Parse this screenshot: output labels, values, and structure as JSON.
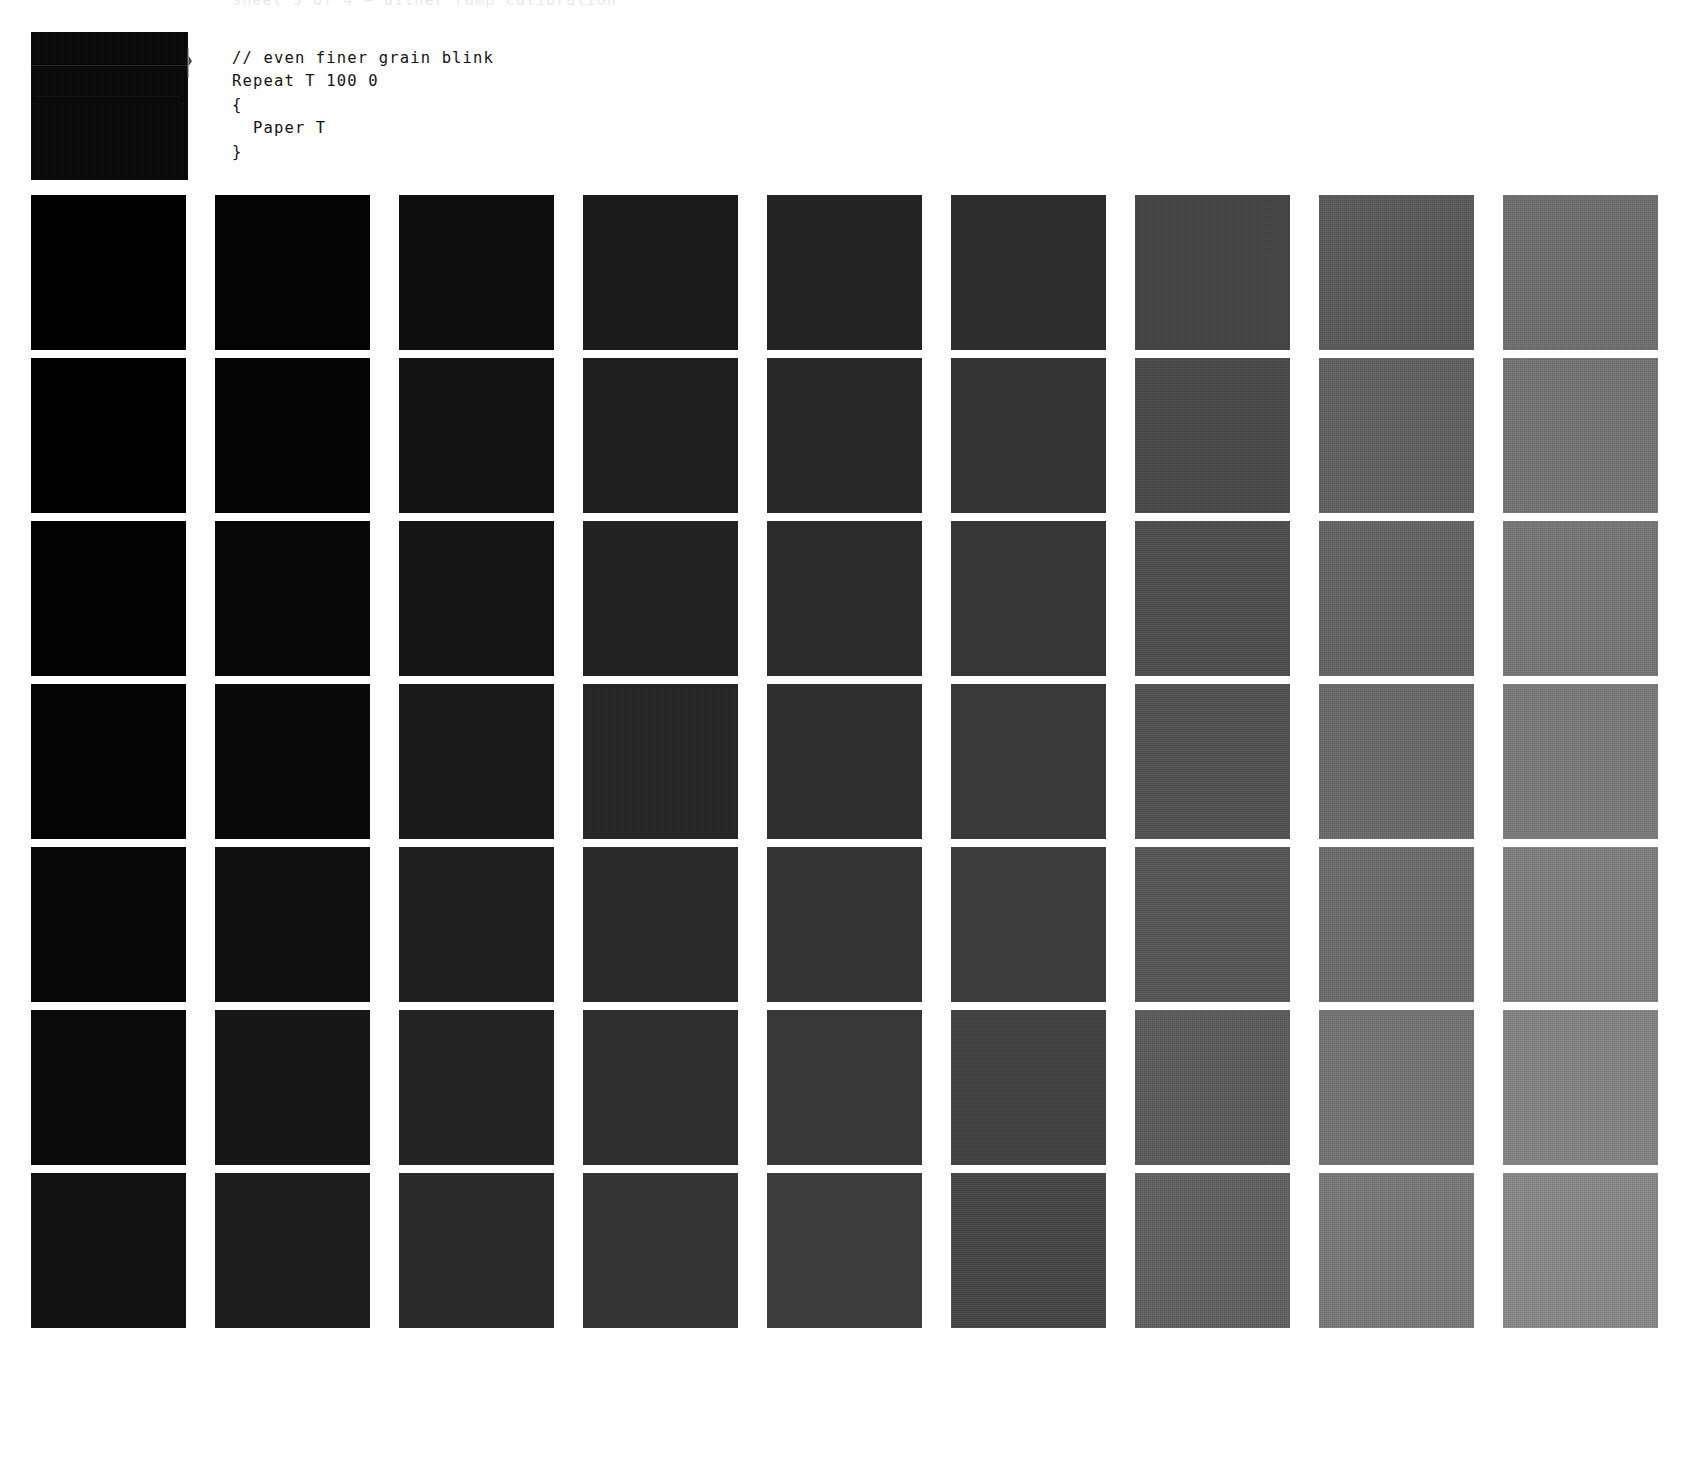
{
  "page": {
    "background": "#ffffff",
    "clipped_header_text": "sheet 3 of 4 — dither ramp calibration",
    "ink_color": "#141414"
  },
  "preview": {
    "name": "render-preview-thumbnail",
    "fill": "#050505",
    "scanline_color": "#2e2e2e",
    "marker_icon": "playhead-marker-icon"
  },
  "code": {
    "language": "paper-script",
    "lines": [
      "// even finer grain blink",
      "Repeat T 100 0",
      "{",
      "  Paper T",
      "}"
    ]
  },
  "grid": {
    "columns": 9,
    "rows": 7,
    "cell_size": 155,
    "col_pitch": 184,
    "row_pitch": 163,
    "origin_x": 31,
    "origin_y": 195,
    "swatches": [
      [
        "#020202",
        "#040404",
        "#0f0f0f",
        "#1b1b1b",
        "#242424",
        "#2d2d2d",
        "#454545",
        "#5b5b5b",
        "#6e6e6e"
      ],
      [
        "#020202",
        "#050505",
        "#131313",
        "#1e1e1e",
        "#282828",
        "#333333",
        "#4b4b4b",
        "#616161",
        "#737373"
      ],
      [
        "#030303",
        "#070707",
        "#151515",
        "#222222",
        "#2b2b2b",
        "#363636",
        "#4f4f4f",
        "#656565",
        "#767676"
      ],
      [
        "#040404",
        "#0a0a0a",
        "#1a1a1a",
        "#262626",
        "#2f2f2f",
        "#3a3a3a",
        "#535353",
        "#696969",
        "#7a7a7a"
      ],
      [
        "#070707",
        "#101010",
        "#1f1f1f",
        "#2a2a2a",
        "#333333",
        "#3e3e3e",
        "#575757",
        "#6d6d6d",
        "#7e7e7e"
      ],
      [
        "#0b0b0b",
        "#171717",
        "#242424",
        "#2f2f2f",
        "#383838",
        "#434343",
        "#5c5c5c",
        "#727272",
        "#828282"
      ],
      [
        "#121212",
        "#1d1d1d",
        "#292929",
        "#343434",
        "#3d3d3d",
        "#484848",
        "#616161",
        "#777777",
        "#868686"
      ]
    ]
  }
}
